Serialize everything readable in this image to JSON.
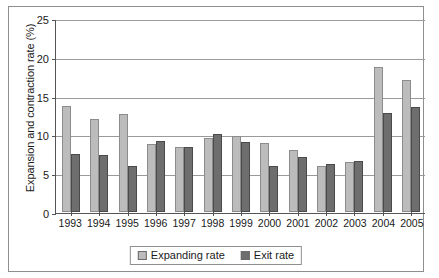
{
  "chart_data": {
    "type": "bar",
    "title": "",
    "xlabel": "",
    "ylabel": "Expansion and contraction rate (%)",
    "ylim": [
      0,
      25
    ],
    "yticks": [
      0,
      5,
      10,
      15,
      20,
      25
    ],
    "grid": true,
    "legend_position": "bottom",
    "categories": [
      "1993",
      "1994",
      "1995",
      "1996",
      "1997",
      "1998",
      "1999",
      "2000",
      "2001",
      "2002",
      "2003",
      "2004",
      "2005"
    ],
    "series": [
      {
        "name": "Expanding rate",
        "color": "#bcbcbc",
        "values": [
          13.7,
          12.0,
          12.6,
          8.8,
          8.4,
          9.6,
          9.8,
          8.9,
          8.0,
          5.9,
          6.5,
          18.7,
          17.0
        ]
      },
      {
        "name": "Exit rate",
        "color": "#6e6e6e",
        "values": [
          7.5,
          7.4,
          5.9,
          9.1,
          8.4,
          10.0,
          9.0,
          5.9,
          7.1,
          6.2,
          6.6,
          12.7,
          13.5
        ]
      }
    ]
  },
  "legend": {
    "entries": [
      {
        "label": "Expanding rate"
      },
      {
        "label": "Exit rate"
      }
    ]
  }
}
